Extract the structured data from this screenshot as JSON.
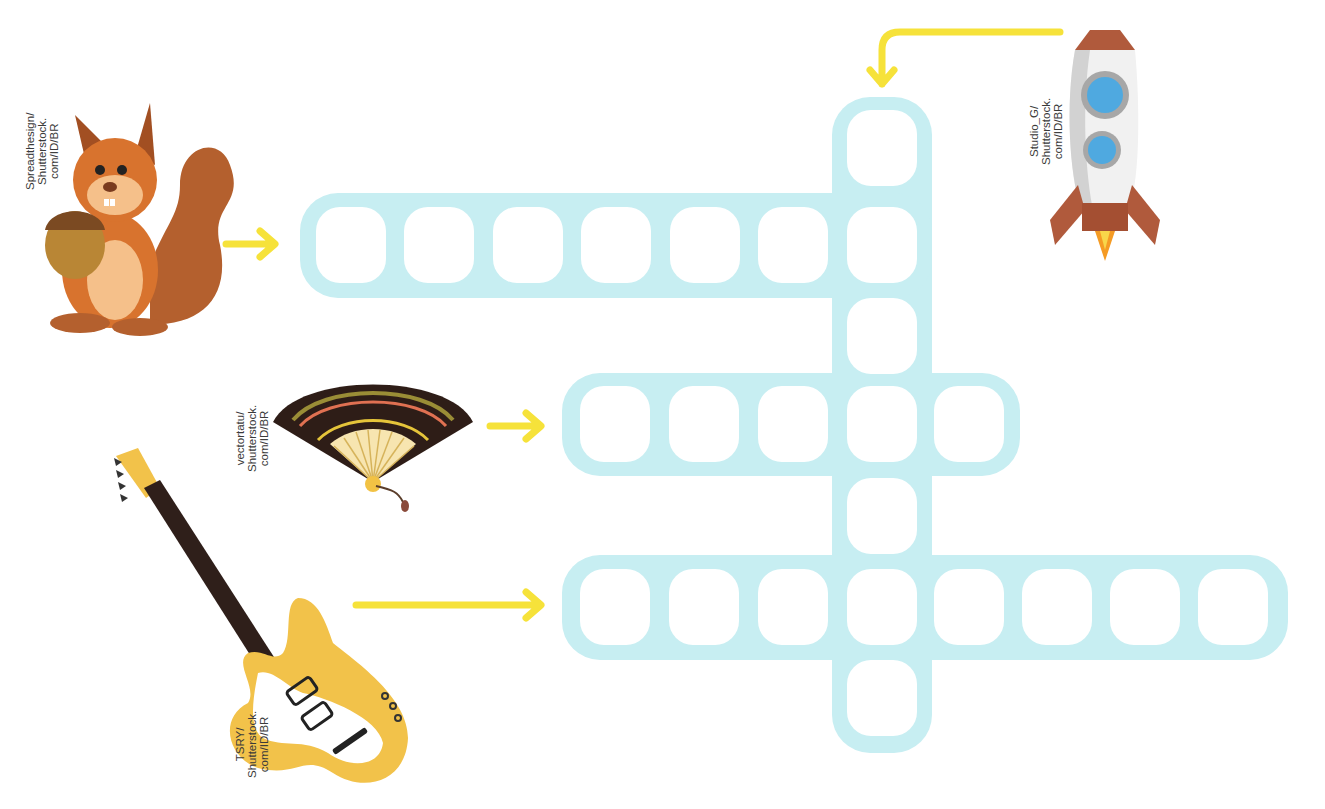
{
  "puzzle": {
    "type": "crossword",
    "grid_color": "#c7eef2",
    "arrow_color": "#f6e23a",
    "words": [
      {
        "id": "rocket",
        "clue_image": "rocket",
        "direction": "down",
        "length": 7
      },
      {
        "id": "squirrel",
        "clue_image": "squirrel",
        "direction": "across",
        "length": 7
      },
      {
        "id": "fan",
        "clue_image": "hand-fan",
        "direction": "across",
        "length": 5
      },
      {
        "id": "guitar",
        "clue_image": "electric-guitar",
        "direction": "across",
        "length": 8
      }
    ]
  },
  "credits": {
    "squirrel": "Spreadthesign/\nShutterstock.\ncom/ID/BR",
    "rocket": "Studio_G/\nShutterstock.\ncom/ID/BR",
    "fan": "vectortatu/\nShutterstock.\ncom/ID/BR",
    "guitar": "TSRY/\nShutterstock.\ncom/ID/BR"
  }
}
